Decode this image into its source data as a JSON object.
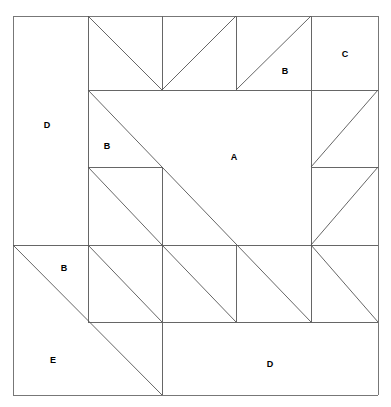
{
  "diagram": {
    "type": "quilt-block-line-drawing",
    "background_color": "#ffffff",
    "line_color": "#555555",
    "border_color": "#777777",
    "label_color": "#000000",
    "canvas": {
      "width": 391,
      "height": 407
    },
    "block_bounds": {
      "x0": 13,
      "y0": 16,
      "x1": 378,
      "y1": 395
    },
    "grid": {
      "columns_x": [
        13,
        88,
        162,
        236,
        311,
        378
      ],
      "rows_y": [
        16,
        90,
        167,
        245,
        322,
        395
      ],
      "cell_width": 74,
      "cell_height": 76
    },
    "labels": [
      {
        "id": "label-c",
        "text": "C",
        "x": 345,
        "y": 54
      },
      {
        "id": "label-b-top",
        "text": "B",
        "x": 285,
        "y": 71
      },
      {
        "id": "label-d-left",
        "text": "D",
        "x": 47,
        "y": 125
      },
      {
        "id": "label-b-mid",
        "text": "B",
        "x": 107,
        "y": 146
      },
      {
        "id": "label-a",
        "text": "A",
        "x": 234,
        "y": 157
      },
      {
        "id": "label-b-low",
        "text": "B",
        "x": 64,
        "y": 268
      },
      {
        "id": "label-e",
        "text": "E",
        "x": 53,
        "y": 360
      },
      {
        "id": "label-d-bottom",
        "text": "D",
        "x": 270,
        "y": 364
      }
    ],
    "segments": {
      "border": [
        {
          "id": "border-top",
          "x1": 13,
          "y1": 16,
          "x2": 378,
          "y2": 16
        },
        {
          "id": "border-right",
          "x1": 378,
          "y1": 16,
          "x2": 378,
          "y2": 395
        },
        {
          "id": "border-bottom",
          "x1": 378,
          "y1": 395,
          "x2": 13,
          "y2": 395
        },
        {
          "id": "border-left",
          "x1": 13,
          "y1": 395,
          "x2": 13,
          "y2": 16
        }
      ],
      "straight": [
        {
          "id": "v-c1-top",
          "x1": 88,
          "y1": 16,
          "x2": 88,
          "y2": 90
        },
        {
          "id": "v-c2-top",
          "x1": 162,
          "y1": 16,
          "x2": 162,
          "y2": 90
        },
        {
          "id": "v-c3-top",
          "x1": 236,
          "y1": 16,
          "x2": 236,
          "y2": 90
        },
        {
          "id": "v-c4-top",
          "x1": 311,
          "y1": 16,
          "x2": 311,
          "y2": 90
        },
        {
          "id": "h-r1-mid",
          "x1": 88,
          "y1": 90,
          "x2": 378,
          "y2": 90
        },
        {
          "id": "v-left-col",
          "x1": 88,
          "y1": 90,
          "x2": 88,
          "y2": 245
        },
        {
          "id": "h-r2-left",
          "x1": 88,
          "y1": 167,
          "x2": 162,
          "y2": 167
        },
        {
          "id": "v-c2-r3",
          "x1": 162,
          "y1": 167,
          "x2": 162,
          "y2": 322
        },
        {
          "id": "h-r3-left",
          "x1": 13,
          "y1": 245,
          "x2": 311,
          "y2": 245
        },
        {
          "id": "h-r3-right",
          "x1": 311,
          "y1": 245,
          "x2": 378,
          "y2": 245
        },
        {
          "id": "v-c4-r2",
          "x1": 311,
          "y1": 90,
          "x2": 311,
          "y2": 167
        },
        {
          "id": "h-r2-right",
          "x1": 311,
          "y1": 167,
          "x2": 378,
          "y2": 167
        },
        {
          "id": "v-c4-r3",
          "x1": 311,
          "y1": 167,
          "x2": 311,
          "y2": 245
        },
        {
          "id": "v-c4-r4",
          "x1": 311,
          "y1": 245,
          "x2": 311,
          "y2": 322
        },
        {
          "id": "v-c3-r4",
          "x1": 236,
          "y1": 245,
          "x2": 236,
          "y2": 322
        },
        {
          "id": "h-r4-bottom",
          "x1": 88,
          "y1": 322,
          "x2": 378,
          "y2": 322
        },
        {
          "id": "v-c1-r4",
          "x1": 88,
          "y1": 245,
          "x2": 88,
          "y2": 322
        },
        {
          "id": "v-c2-r5",
          "x1": 162,
          "y1": 322,
          "x2": 162,
          "y2": 395
        }
      ],
      "diagonals": [
        {
          "id": "d-top-1",
          "x1": 88,
          "y1": 16,
          "x2": 162,
          "y2": 90
        },
        {
          "id": "d-top-2",
          "x1": 236,
          "y1": 16,
          "x2": 162,
          "y2": 90
        },
        {
          "id": "d-top-3",
          "x1": 311,
          "y1": 16,
          "x2": 236,
          "y2": 90
        },
        {
          "id": "d-main-long",
          "x1": 88,
          "y1": 90,
          "x2": 311,
          "y2": 322
        },
        {
          "id": "d-mid-left",
          "x1": 88,
          "y1": 167,
          "x2": 162,
          "y2": 245
        },
        {
          "id": "d-mid-left-2",
          "x1": 88,
          "y1": 245,
          "x2": 162,
          "y2": 322
        },
        {
          "id": "d-right-up-1",
          "x1": 311,
          "y1": 167,
          "x2": 378,
          "y2": 90
        },
        {
          "id": "d-right-up-2",
          "x1": 311,
          "y1": 245,
          "x2": 378,
          "y2": 167
        },
        {
          "id": "d-right-dn-1",
          "x1": 311,
          "y1": 245,
          "x2": 378,
          "y2": 322
        },
        {
          "id": "d-mid-c3",
          "x1": 162,
          "y1": 245,
          "x2": 236,
          "y2": 322
        },
        {
          "id": "d-e-long",
          "x1": 13,
          "y1": 245,
          "x2": 162,
          "y2": 395
        }
      ]
    }
  }
}
